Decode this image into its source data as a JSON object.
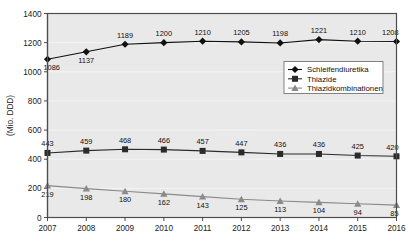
{
  "chart_data": {
    "type": "line",
    "title": "",
    "xlabel": "",
    "ylabel": "(Mio. DDD)",
    "categories": [
      "2007",
      "2008",
      "2009",
      "2010",
      "2011",
      "2012",
      "2013",
      "2014",
      "2015",
      "2016"
    ],
    "ylim": [
      0,
      1400
    ],
    "yticks": [
      0,
      200,
      400,
      600,
      800,
      1000,
      1200,
      1400
    ],
    "grid": true,
    "legend_position": "center-right",
    "series": [
      {
        "name": "Schleifendiuretika",
        "marker": "diamond",
        "color": "#101010",
        "values": [
          1086,
          1137,
          1189,
          1200,
          1210,
          1205,
          1198,
          1221,
          1210,
          1208
        ],
        "label_positions": [
          "below",
          "below",
          "above",
          "above",
          "above",
          "above",
          "above",
          "above",
          "above",
          "above"
        ]
      },
      {
        "name": "Thiazide",
        "marker": "square",
        "color": "#2b2b2b",
        "values": [
          443,
          459,
          468,
          466,
          457,
          447,
          436,
          436,
          425,
          420
        ],
        "label_positions": [
          "above",
          "above",
          "above",
          "above",
          "above",
          "above",
          "above",
          "above",
          "above",
          "above"
        ]
      },
      {
        "name": "Thiazidkombinationen",
        "marker": "triangle",
        "color": "#8a8a8a",
        "values": [
          219,
          198,
          180,
          162,
          143,
          125,
          113,
          104,
          94,
          85
        ],
        "label_positions": [
          "below",
          "below",
          "below",
          "below",
          "below",
          "below",
          "below",
          "below",
          "below",
          "below"
        ]
      }
    ]
  },
  "axes": {
    "y_tick_labels": [
      "0",
      "200",
      "400",
      "600",
      "800",
      "1000",
      "1200",
      "1400"
    ],
    "x_tick_labels": [
      "2007",
      "2008",
      "2009",
      "2010",
      "2011",
      "2012",
      "2013",
      "2014",
      "2015",
      "2016"
    ],
    "y_axis_title": "(Mio. DDD)"
  },
  "legend": {
    "items": [
      {
        "label": "Schleifendiuretika",
        "marker": "diamond",
        "color": "#101010"
      },
      {
        "label": "Thiazide",
        "marker": "square",
        "color": "#2b2b2b"
      },
      {
        "label": "Thiazidkombinationen",
        "marker": "triangle",
        "color": "#8a8a8a"
      }
    ]
  },
  "colors": {
    "plot_background": "#e9e9e9",
    "plot_border": "#4d4d4d",
    "gridline": "#ffffff",
    "axis_line": "#4d4d4d",
    "legend_background": "#ffffff",
    "legend_border": "#767676"
  },
  "data_labels": {
    "schleifendiuretika": [
      "1086",
      "1137",
      "1189",
      "1200",
      "1210",
      "1205",
      "1198",
      "1221",
      "1210",
      "1208"
    ],
    "thiazide": [
      "443",
      "459",
      "468",
      "466",
      "457",
      "447",
      "436",
      "436",
      "425",
      "420"
    ],
    "thiazidkombinationen": [
      "219",
      "198",
      "180",
      "162",
      "143",
      "125",
      "113",
      "104",
      "94",
      "85"
    ]
  }
}
